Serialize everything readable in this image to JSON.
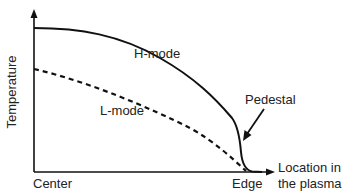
{
  "diagram": {
    "title": "",
    "axes": {
      "y_label": "Temperature",
      "x_label_line1": "Location in",
      "x_label_line2": "the plasma",
      "x_ticks": {
        "start": "Center",
        "end": "Edge"
      }
    },
    "curves": [
      {
        "name": "H-mode",
        "style": "solid",
        "color": "#111111"
      },
      {
        "name": "L-mode",
        "style": "dashed",
        "color": "#111111"
      }
    ],
    "annotations": [
      {
        "text": "Pedestal",
        "points_to": "H-mode steep edge drop"
      }
    ]
  }
}
